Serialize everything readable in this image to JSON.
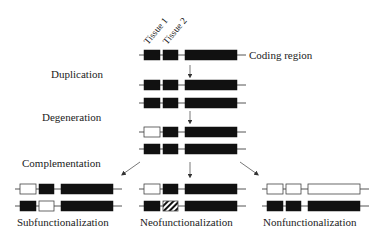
{
  "diagram": {
    "colors": {
      "ink": "#111111",
      "line": "#555555",
      "fill_white": "#ffffff",
      "background": "#ffffff"
    },
    "tissue_labels": [
      "Tissue 1",
      "Tissue 2"
    ],
    "coding_region_label": "Coding region",
    "stages": {
      "duplication": "Duplication",
      "degeneration": "Degeneration",
      "complementation": "Complementation"
    },
    "outcomes": {
      "subfunctionalization": "Subfunctionalization",
      "neofunctionalization": "Neofunctionalization",
      "nonfunctionalization": "Nonfunctionalization"
    },
    "gene_rows": [
      {
        "id": "original",
        "x": 139,
        "y": 55,
        "boxes": [
          "black",
          "black",
          "black"
        ]
      },
      {
        "id": "dup-1",
        "x": 139,
        "y": 85,
        "boxes": [
          "black",
          "black",
          "black"
        ]
      },
      {
        "id": "dup-2",
        "x": 139,
        "y": 103,
        "boxes": [
          "black",
          "black",
          "black"
        ]
      },
      {
        "id": "deg-1",
        "x": 139,
        "y": 132,
        "boxes": [
          "white",
          "black",
          "black"
        ]
      },
      {
        "id": "deg-2",
        "x": 139,
        "y": 149,
        "boxes": [
          "black",
          "black",
          "black"
        ]
      },
      {
        "id": "sub-1",
        "x": 15,
        "y": 189,
        "boxes": [
          "white",
          "black",
          "black"
        ]
      },
      {
        "id": "sub-2",
        "x": 15,
        "y": 206,
        "boxes": [
          "black",
          "white",
          "black"
        ]
      },
      {
        "id": "neo-1",
        "x": 139,
        "y": 189,
        "boxes": [
          "white",
          "black",
          "black"
        ]
      },
      {
        "id": "neo-2",
        "x": 139,
        "y": 206,
        "boxes": [
          "black",
          "hatched",
          "black"
        ]
      },
      {
        "id": "non-1",
        "x": 262,
        "y": 189,
        "boxes": [
          "white",
          "white",
          "white"
        ]
      },
      {
        "id": "non-2",
        "x": 262,
        "y": 206,
        "boxes": [
          "black",
          "black",
          "black"
        ]
      }
    ]
  }
}
